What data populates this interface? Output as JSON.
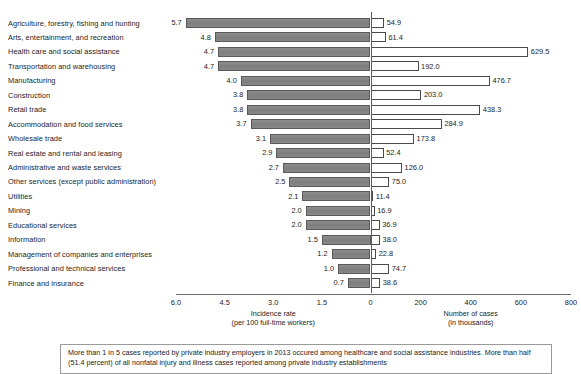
{
  "header": {
    "clipped_title": ""
  },
  "chart_data": {
    "type": "bar",
    "title": "",
    "subtitle": "",
    "orientation": "horizontal-paired-pyramid",
    "grid": false,
    "legend_position": "none",
    "categories": [
      "Agriculture, forestry, fishing and hunting",
      "Arts, entertainment, and recreation",
      "Health care and social assistance",
      "Transportation and warehousing",
      "Manufacturing",
      "Construction",
      "Retail trade",
      "Accommodation and food services",
      "Wholesale trade",
      "Real estate and rental and leasing",
      "Administrative and waste services",
      "Other services (except public administration)",
      "Utilities",
      "Mining",
      "Educational services",
      "Information",
      "Management of companies and enterprises",
      "Professional and technical services",
      "Finance and insurance"
    ],
    "series": [
      {
        "name": "Incidence rate",
        "axis": "left",
        "unit": "per 100 full-time workers",
        "values": [
          5.7,
          4.8,
          4.7,
          4.7,
          4.0,
          3.8,
          3.8,
          3.7,
          3.1,
          2.9,
          2.7,
          2.5,
          2.1,
          2.0,
          2.0,
          1.5,
          1.2,
          1.0,
          0.7
        ],
        "labels": [
          "5.7",
          "4.8",
          "4.7",
          "4.7",
          "4.0",
          "3.8",
          "3.8",
          "3.7",
          "3.1",
          "2.9",
          "2.7",
          "2.5",
          "2.1",
          "2.0",
          "2.0",
          "1.5",
          "1.2",
          "1.0",
          "0.7"
        ]
      },
      {
        "name": "Number of cases",
        "axis": "right",
        "unit": "in thousands",
        "values": [
          54.9,
          61.4,
          629.5,
          192.0,
          476.7,
          203.0,
          438.3,
          284.9,
          173.8,
          52.4,
          126.0,
          75.0,
          11.4,
          16.9,
          36.9,
          38.0,
          22.8,
          74.7,
          38.6
        ],
        "labels": [
          "54.9",
          "61.4",
          "629.5",
          "192.0",
          "476.7",
          "203.0",
          "438.3",
          "284.9",
          "173.8",
          "52.4",
          "126.0",
          "75.0",
          "11.4",
          "16.9",
          "36.9",
          "38.0",
          "22.8",
          "74.7",
          "38.6"
        ]
      }
    ],
    "left_axis": {
      "label": "Incidence rate",
      "sublabel": "(per 100 full-time workers)",
      "ticks": [
        "6.0",
        "4.5",
        "3.0",
        "1.5",
        "0"
      ],
      "tick_values": [
        6.0,
        4.5,
        3.0,
        1.5,
        0
      ],
      "range": [
        6.0,
        0
      ]
    },
    "right_axis": {
      "label": "Number of cases",
      "sublabel": "(in thousands)",
      "ticks": [
        "0",
        "200",
        "400",
        "600",
        "800"
      ],
      "tick_values": [
        0,
        200,
        400,
        600,
        800
      ],
      "range": [
        0,
        800
      ]
    },
    "colors": {
      "left_bar_fill": "#878787",
      "left_bar_stroke": "#5a5a5a",
      "right_bar_fill": "#ffffff",
      "right_bar_stroke": "#4a4a4a",
      "axis": "#6a6a6a",
      "text": "#1c1c1c"
    }
  },
  "caption": {
    "text": "More than 1 in 5 cases reported by private industry employers in 2013 occured among healthcare and social assistance industries. More than half (51.4 percent) of all nonfatal injury and illness cases reported among private industry establishments"
  }
}
